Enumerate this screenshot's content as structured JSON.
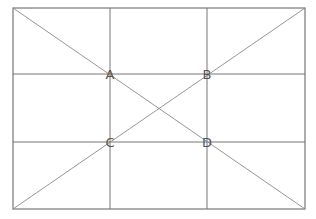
{
  "diagram": {
    "title": "",
    "type": "rule-of-thirds-grid",
    "frame": {
      "x1": 13,
      "y1": 8,
      "x2": 305,
      "y2": 209
    },
    "grid": {
      "vertical_x": [
        110,
        207
      ],
      "horizontal_y": [
        74,
        142
      ]
    },
    "diagonals": [
      {
        "from": "top-left",
        "to": "bottom-right"
      },
      {
        "from": "bottom-left",
        "to": "top-right"
      }
    ],
    "points": [
      {
        "label": "A",
        "x": 110,
        "y": 74
      },
      {
        "label": "B",
        "x": 207,
        "y": 74
      },
      {
        "label": "C",
        "x": 110,
        "y": 142
      },
      {
        "label": "D",
        "x": 207,
        "y": 142
      }
    ],
    "colors": {
      "line": "#777777",
      "diagonal": "#8a8a8a",
      "label": "#555555",
      "background": "#ffffff"
    }
  }
}
